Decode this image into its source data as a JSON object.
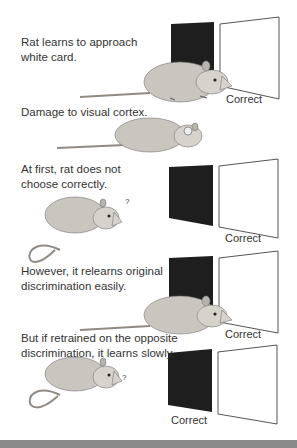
{
  "figure": {
    "panels": [
      {
        "caption_lines": [
          "Rat learns to approach",
          "white card."
        ],
        "card_label": "Correct",
        "correct_card": "white",
        "rat_state": "approaching"
      },
      {
        "caption_lines": [
          "Damage to visual cortex."
        ],
        "rat_state": "lesioned"
      },
      {
        "caption_lines": [
          "At first, rat does not",
          "choose correctly."
        ],
        "card_label": "Correct",
        "correct_card": "white",
        "rat_state": "confused",
        "question_mark": "?"
      },
      {
        "caption_lines": [
          "However, it relearns original",
          "discrimination easily."
        ],
        "card_label": "Correct",
        "correct_card": "white",
        "rat_state": "approaching"
      },
      {
        "caption_lines": [
          "But if retrained on the opposite",
          "discrimination, it learns slowly."
        ],
        "card_label": "Correct",
        "correct_card": "black",
        "rat_state": "confused",
        "question_mark": "?"
      }
    ],
    "colors": {
      "black_card": "#1e1e1e",
      "white_card_border": "#555555",
      "rat_fill": "#c9c5bf",
      "rat_shade": "#8f8a84",
      "bottom_band": "#8a8a8a"
    }
  }
}
